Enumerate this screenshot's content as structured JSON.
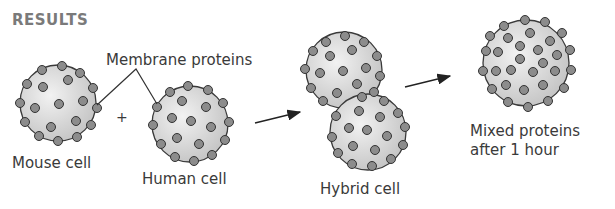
{
  "figure": {
    "title": "RESULTS",
    "labels": {
      "membrane_proteins": "Membrane proteins",
      "plus": "+",
      "mouse_cell": "Mouse cell",
      "human_cell": "Human cell",
      "hybrid_cell": "Hybrid cell",
      "mixed_line1": "Mixed proteins",
      "mixed_line2": "after 1 hour"
    },
    "colors": {
      "cell_fill": "#d4d4d4",
      "cell_highlight": "#efefef",
      "outline": "#3a3a3a",
      "protein_fill": "#8c8c8c",
      "text": "#3a3a3a",
      "title": "#7a7a7a"
    },
    "stages": [
      "Mouse cell",
      "Human cell",
      "Hybrid cell",
      "Mixed proteins after 1 hour"
    ]
  }
}
